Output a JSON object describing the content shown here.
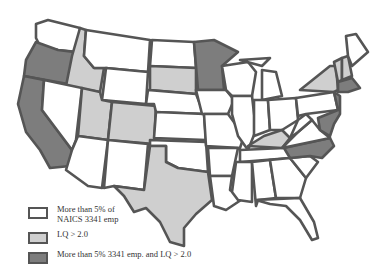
{
  "colors": {
    "none": "#ffffff",
    "emp_gt_5pct": "#ffffff",
    "lq_gt_2": "#cfcfcf",
    "both": "#7d7d7d",
    "border": "#555555"
  },
  "legend": {
    "items": [
      {
        "label_line1": "More than 5% of",
        "label_line2": "NAICS 3341 emp",
        "category": "emp_gt_5pct",
        "fill": "#ffffff"
      },
      {
        "label_line1": "LQ > 2.0",
        "label_line2": "",
        "category": "lq_gt_2",
        "fill": "#cfcfcf"
      },
      {
        "label_line1": "More than 5% 3341 emp. and LQ > 2.0",
        "label_line2": "",
        "category": "both",
        "fill": "#7d7d7d"
      }
    ]
  },
  "states": {
    "both": [
      "WA-islands",
      "OR",
      "CA",
      "MN",
      "NC",
      "MA",
      "NJ-MD-DE"
    ],
    "lq_gt_2": [
      "ID",
      "UT",
      "CO",
      "SD",
      "TX",
      "KY",
      "NY",
      "VT",
      "NH"
    ],
    "none": [
      "MT",
      "WY",
      "ND",
      "NE",
      "KS",
      "NV",
      "AZ",
      "NM",
      "OK",
      "IA",
      "MO",
      "AR",
      "LA",
      "WI",
      "IL",
      "MI",
      "IN",
      "OH",
      "PA",
      "TN",
      "MS",
      "AL",
      "GA",
      "FL",
      "SC",
      "VA",
      "WV",
      "ME"
    ]
  }
}
